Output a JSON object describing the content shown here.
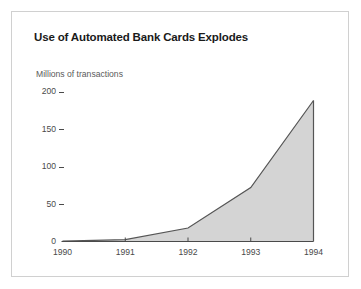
{
  "figure": {
    "title": "Use of Automated Bank Cards Explodes",
    "frame_border_color": "#d0d0d0",
    "background_color": "#ffffff"
  },
  "chart_data": {
    "type": "area",
    "title": "Use of Automated Bank Cards Explodes",
    "subtitle": "",
    "xlabel": "",
    "ylabel": "Millions of transactions",
    "categories": [
      "1990",
      "1991",
      "1992",
      "1993",
      "1994"
    ],
    "x": [
      1990,
      1991,
      1992,
      1993,
      1994
    ],
    "values": [
      0.5,
      2.5,
      18,
      72,
      188
    ],
    "series": [
      {
        "name": "Millions of transactions",
        "values": [
          0.5,
          2.5,
          18,
          72,
          188
        ]
      }
    ],
    "xlim": [
      1990,
      1994
    ],
    "ylim": [
      0,
      200
    ],
    "yticks": [
      0,
      50,
      100,
      150,
      200
    ],
    "ytick_labels": [
      "0",
      "50",
      "100",
      "150",
      "200"
    ],
    "xticks": [
      1990,
      1991,
      1992,
      1993,
      1994
    ],
    "xtick_labels": [
      "1990",
      "1991",
      "1992",
      "1993",
      "1994"
    ],
    "grid": false,
    "legend": false,
    "legend_position": "none",
    "fill_color": "#d4d4d4",
    "line_color": "#555555",
    "axis_color": "#4a4a4a"
  }
}
